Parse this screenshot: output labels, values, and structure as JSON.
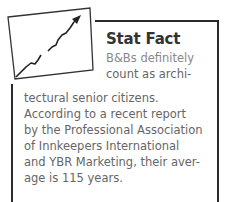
{
  "sidebar_box": {
    "heading": "Stat Fact",
    "icon": "rising-chart-arrow-icon",
    "lines": [
      "B&Bs definitely",
      "count as archi-",
      "tectural senior citizens.",
      "According to a recent report",
      "by the Professional Association",
      "of Innkeepers International",
      "and YBR Marketing, their aver-",
      "age is 115 years."
    ]
  },
  "colors": {
    "border": "#2a2a2a",
    "heading": "#333333",
    "body_text": "#666666"
  }
}
